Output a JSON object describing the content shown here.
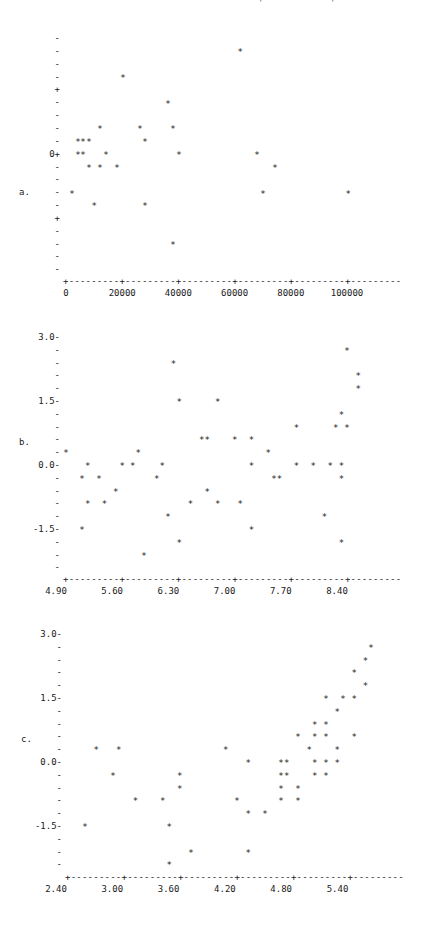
{
  "chart_data": [
    {
      "panel": "a.",
      "type": "scatter",
      "title": "",
      "xlabel": "",
      "ylabel": "",
      "marker": "*",
      "x_ticks": [
        0,
        20000,
        40000,
        60000,
        80000,
        100000
      ],
      "x_tick_labels": [
        "0",
        "20000",
        "40000",
        "60000",
        "80000",
        "100000"
      ],
      "y_tick_labels_visible": [
        "0"
      ],
      "y_axis_note": "y ticks are unlabeled except 0; '+' major marks at +5 and -5 tick units; values below in tick units",
      "ylim": [
        -9,
        9
      ],
      "xlim": [
        0,
        120000
      ],
      "points": [
        [
          62000,
          8
        ],
        [
          20300,
          6
        ],
        [
          36300,
          4
        ],
        [
          12100,
          2
        ],
        [
          26300,
          2
        ],
        [
          38100,
          2
        ],
        [
          4300,
          1
        ],
        [
          6000,
          1
        ],
        [
          8200,
          1
        ],
        [
          28100,
          1
        ],
        [
          4300,
          0
        ],
        [
          6000,
          0
        ],
        [
          14200,
          0
        ],
        [
          40200,
          0
        ],
        [
          68000,
          0
        ],
        [
          8200,
          -1
        ],
        [
          12100,
          -1
        ],
        [
          18100,
          -1
        ],
        [
          74400,
          -1
        ],
        [
          2100,
          -3
        ],
        [
          70100,
          -3
        ],
        [
          100400,
          -3
        ],
        [
          10000,
          -4
        ],
        [
          28100,
          -4
        ],
        [
          38100,
          -7
        ]
      ]
    },
    {
      "panel": "b.",
      "type": "scatter",
      "title": "",
      "xlabel": "",
      "ylabel": "",
      "marker": "*",
      "x_ticks": [
        4.9,
        5.6,
        6.3,
        7.0,
        7.7,
        8.4
      ],
      "x_tick_labels": [
        "4.90",
        "5.60",
        "6.30",
        "7.00",
        "7.70",
        "8.40"
      ],
      "y_ticks": [
        3.0,
        1.5,
        0.0,
        -1.5
      ],
      "y_tick_labels": [
        "3.0",
        "1.5",
        "0.0",
        "-1.5"
      ],
      "ylim": [
        -2.4,
        3.0
      ],
      "xlim": [
        4.9,
        9.1
      ],
      "points": [
        [
          4.9,
          0.3
        ],
        [
          5.1,
          -0.3
        ],
        [
          5.17,
          0.0
        ],
        [
          5.17,
          -0.9
        ],
        [
          5.1,
          -1.5
        ],
        [
          5.31,
          -0.3
        ],
        [
          5.38,
          -0.9
        ],
        [
          5.52,
          -0.6
        ],
        [
          5.6,
          0.0
        ],
        [
          5.73,
          0.0
        ],
        [
          5.8,
          0.3
        ],
        [
          5.87,
          -2.1
        ],
        [
          6.03,
          -0.3
        ],
        [
          6.1,
          0.0
        ],
        [
          6.17,
          -1.2
        ],
        [
          6.24,
          2.4
        ],
        [
          6.31,
          1.5
        ],
        [
          6.31,
          -1.8
        ],
        [
          6.45,
          -0.9
        ],
        [
          6.59,
          0.6
        ],
        [
          6.66,
          0.6
        ],
        [
          6.66,
          -0.6
        ],
        [
          6.79,
          1.5
        ],
        [
          6.79,
          -0.9
        ],
        [
          7.0,
          0.6
        ],
        [
          7.07,
          -0.9
        ],
        [
          7.21,
          0.6
        ],
        [
          7.21,
          0.0
        ],
        [
          7.21,
          -1.5
        ],
        [
          7.42,
          0.3
        ],
        [
          7.49,
          -0.3
        ],
        [
          7.56,
          -0.3
        ],
        [
          7.77,
          0.9
        ],
        [
          7.77,
          0.0
        ],
        [
          7.98,
          0.0
        ],
        [
          8.12,
          -1.2
        ],
        [
          8.19,
          0.0
        ],
        [
          8.26,
          0.9
        ],
        [
          8.33,
          1.2
        ],
        [
          8.33,
          0.0
        ],
        [
          8.33,
          -0.3
        ],
        [
          8.33,
          -1.8
        ],
        [
          8.4,
          2.7
        ],
        [
          8.4,
          0.9
        ],
        [
          8.54,
          2.1
        ],
        [
          8.54,
          1.8
        ]
      ]
    },
    {
      "panel": "c.",
      "type": "scatter",
      "title": "",
      "xlabel": "",
      "ylabel": "",
      "marker": "*",
      "x_ticks": [
        2.4,
        3.0,
        3.6,
        4.2,
        4.8,
        5.4
      ],
      "x_tick_labels": [
        "2.40",
        "3.00",
        "3.60",
        "4.20",
        "4.80",
        "5.40"
      ],
      "y_ticks": [
        3.0,
        1.5,
        0.0,
        -1.5
      ],
      "y_tick_labels": [
        "3.0",
        "1.5",
        "0.0",
        "-1.5"
      ],
      "ylim": [
        -2.4,
        3.0
      ],
      "xlim": [
        2.4,
        5.97
      ],
      "points": [
        [
          2.58,
          -1.5
        ],
        [
          2.7,
          0.3
        ],
        [
          2.88,
          -0.3
        ],
        [
          2.94,
          0.3
        ],
        [
          3.12,
          -0.9
        ],
        [
          3.41,
          -0.9
        ],
        [
          3.48,
          -1.5
        ],
        [
          3.48,
          -2.4
        ],
        [
          3.59,
          -0.3
        ],
        [
          3.59,
          -0.6
        ],
        [
          3.71,
          -2.1
        ],
        [
          4.08,
          0.3
        ],
        [
          4.2,
          -0.9
        ],
        [
          4.32,
          0.0
        ],
        [
          4.32,
          -1.2
        ],
        [
          4.32,
          -2.1
        ],
        [
          4.5,
          -1.2
        ],
        [
          4.67,
          0.0
        ],
        [
          4.67,
          -0.3
        ],
        [
          4.67,
          -0.6
        ],
        [
          4.67,
          -0.9
        ],
        [
          4.73,
          0.0
        ],
        [
          4.73,
          -0.3
        ],
        [
          4.85,
          0.6
        ],
        [
          4.85,
          -0.6
        ],
        [
          4.85,
          -0.9
        ],
        [
          4.97,
          0.3
        ],
        [
          5.03,
          0.9
        ],
        [
          5.03,
          0.6
        ],
        [
          5.03,
          0.0
        ],
        [
          5.03,
          -0.3
        ],
        [
          5.15,
          1.5
        ],
        [
          5.15,
          0.9
        ],
        [
          5.15,
          0.6
        ],
        [
          5.15,
          0.0
        ],
        [
          5.15,
          -0.3
        ],
        [
          5.27,
          1.2
        ],
        [
          5.27,
          0.3
        ],
        [
          5.27,
          0.0
        ],
        [
          5.33,
          1.5
        ],
        [
          5.45,
          2.1
        ],
        [
          5.45,
          1.5
        ],
        [
          5.45,
          0.6
        ],
        [
          5.57,
          2.4
        ],
        [
          5.57,
          1.8
        ],
        [
          5.63,
          2.7
        ]
      ]
    }
  ],
  "panels": {
    "a": {
      "label": "a.",
      "zero_label": "0+"
    },
    "b": {
      "label": "b."
    },
    "c": {
      "label": "c."
    }
  }
}
